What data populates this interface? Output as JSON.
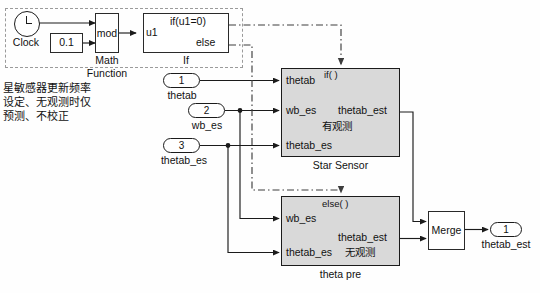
{
  "diagram": {
    "type": "simulink-block-diagram",
    "colors": {
      "block_fill": "#d9d9d9",
      "block_border": "#1b1b1b",
      "wire": "#1b1b1b",
      "control_wire": "#4a4a4a",
      "dash_box": "#9a9a9a",
      "background": "#fefefe"
    }
  },
  "annotation": {
    "text": "星敏感器更新频率\n设定、无观测时仅\n预测、不校正"
  },
  "subsystem_box": {
    "name": "trigger-rate-group",
    "style": "dashed"
  },
  "blocks": {
    "clock": {
      "label": "Clock",
      "icon": "clock-icon"
    },
    "constant": {
      "value": "0.1"
    },
    "math_function": {
      "op": "mod",
      "caption_line1": "Math",
      "caption_line2": "Function"
    },
    "if_block": {
      "input": "u1",
      "cond_true": "if(u1=0)",
      "cond_false": "else",
      "caption": "If"
    },
    "star_sensor": {
      "header": "if( )",
      "chinese": "有观测",
      "caption": "Star Sensor",
      "inputs": [
        "thetab",
        "wb_es",
        "thetab_es"
      ],
      "outputs": [
        "thetab_est"
      ]
    },
    "theta_pre": {
      "header": "else( )",
      "chinese": "无观测",
      "caption": "theta pre",
      "inputs": [
        "wb_es",
        "thetab_es"
      ],
      "outputs": [
        "thetab_est"
      ]
    },
    "merge": {
      "label": "Merge"
    }
  },
  "inports": [
    {
      "number": "1",
      "label": "thetab"
    },
    {
      "number": "2",
      "label": "wb_es"
    },
    {
      "number": "3",
      "label": "thetab_es"
    }
  ],
  "outports": [
    {
      "number": "1",
      "label": "thetab_est"
    }
  ]
}
